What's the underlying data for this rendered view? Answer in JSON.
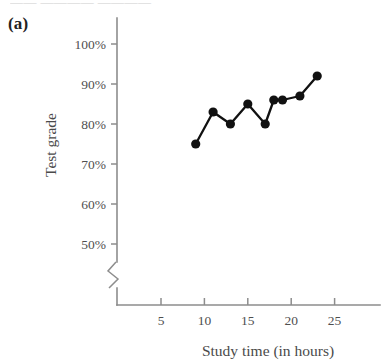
{
  "panel": {
    "label": "(a)",
    "top_cut_text": "—— ————  ————"
  },
  "chart_data": {
    "type": "scatter",
    "title": "",
    "xlabel": "Study time (in hours)",
    "ylabel": "Test grade",
    "x": [
      9,
      11,
      13,
      15,
      17,
      18,
      19,
      21,
      23
    ],
    "values": [
      75,
      83,
      80,
      85,
      80,
      86,
      86,
      87,
      92
    ],
    "point_labels": [
      "75%",
      "83%",
      "80%",
      "85%",
      "80%",
      "86%",
      "86%",
      "87%",
      "92%"
    ],
    "xlim": [
      0,
      28
    ],
    "ylim": [
      45,
      102
    ],
    "xticks": [
      5,
      10,
      15,
      20,
      25
    ],
    "xtick_labels": [
      "5",
      "10",
      "15",
      "20",
      "25"
    ],
    "yticks": [
      50,
      60,
      70,
      80,
      90,
      100
    ],
    "ytick_labels": [
      "50%",
      "60%",
      "70%",
      "80%",
      "90%",
      "100%"
    ],
    "grid": false,
    "legend": null,
    "y_axis_break": true,
    "marker": "filled-circle",
    "line_connected": true,
    "series_color": "#111111",
    "axis_color": "#8d8d8d"
  }
}
